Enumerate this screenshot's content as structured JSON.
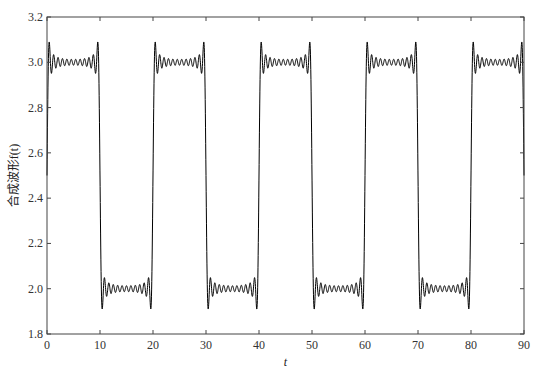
{
  "chart_data": {
    "type": "line",
    "title": "",
    "xlabel": "t",
    "ylabel": "合成波形f(t)",
    "xlim": [
      0,
      90
    ],
    "ylim": [
      1.8,
      3.2
    ],
    "xticks": [
      0,
      10,
      20,
      30,
      40,
      50,
      60,
      70,
      80,
      90
    ],
    "yticks": [
      1.8,
      2.0,
      2.2,
      2.4,
      2.6,
      2.8,
      3.0,
      3.2
    ],
    "ytick_labels": [
      "1.8",
      "2.0",
      "2.2",
      "2.4",
      "2.6",
      "2.8",
      "3.0",
      "3.2"
    ],
    "grid": false,
    "legend": null,
    "series": [
      {
        "name": "f(t)",
        "description": "Fourier-series synthesis of a square wave (Gibbs phenomenon): high level 3.0 for t in (0,10), (20,30), ...; low level 2.0 for t in (10,20), (30,40), ...; overshoot peaks ~3.09 and troughs ~1.91 near each jump",
        "period": 20,
        "mean": 2.5,
        "amplitude": 0.5,
        "harmonics_max_odd": 23,
        "color": "#000000",
        "x": [
          0,
          5,
          9.5,
          10,
          10.5,
          15,
          19.5,
          20,
          20.5,
          25,
          29.5,
          30,
          30.5,
          35,
          39.5,
          40,
          40.5,
          45,
          49.5,
          50,
          50.5,
          55,
          59.5,
          60,
          60.5,
          65,
          69.5,
          70,
          70.5,
          75,
          79.5,
          80,
          80.5,
          85,
          89.5,
          90
        ],
        "values": [
          2.5,
          3.0,
          3.09,
          2.5,
          1.91,
          2.0,
          1.91,
          2.5,
          3.09,
          3.0,
          3.09,
          2.5,
          1.91,
          2.0,
          1.91,
          2.5,
          3.09,
          3.0,
          3.09,
          2.5,
          1.91,
          2.0,
          1.91,
          2.5,
          3.09,
          3.0,
          3.09,
          2.5,
          1.91,
          2.0,
          1.91,
          2.5,
          3.09,
          3.0,
          3.09,
          2.5
        ]
      }
    ]
  },
  "axes": {
    "x_label": "t",
    "y_label": "合成波形f(t)"
  }
}
